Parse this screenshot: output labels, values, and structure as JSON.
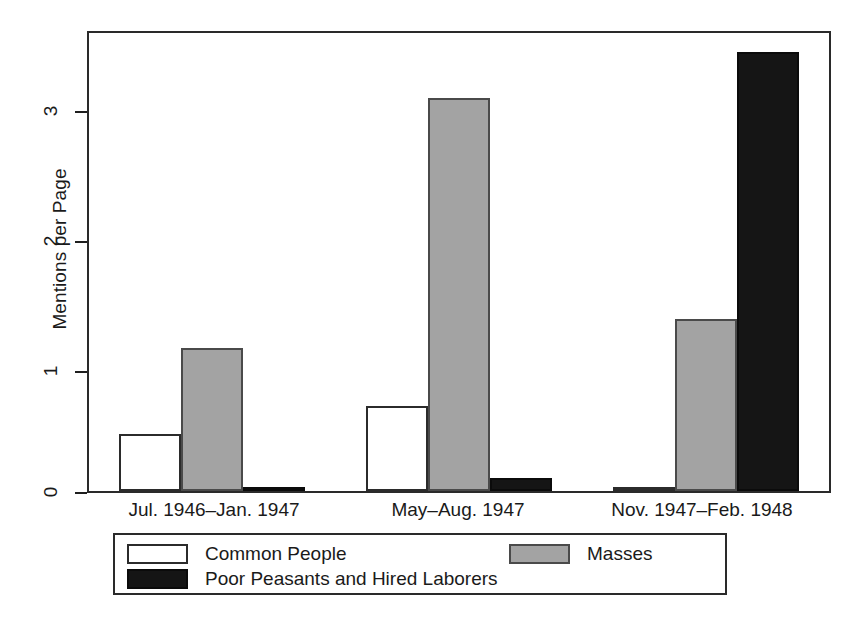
{
  "chart_data": {
    "type": "bar",
    "title": "",
    "xlabel": "",
    "ylabel": "Mentions per Page",
    "ylim": [
      0,
      3.55
    ],
    "yticks": [
      "0",
      "1",
      "2",
      "3"
    ],
    "grid": false,
    "legend_position": "bottom",
    "categories": [
      "Jul. 1946–Jan. 1947",
      "May–Aug. 1947",
      "Nov. 1947–Feb. 1948"
    ],
    "series": [
      {
        "name": "Common People",
        "color": "#ffffff",
        "edge_color": "#2b2b2b",
        "values": [
          0.44,
          0.66,
          0.01
        ]
      },
      {
        "name": "Masses",
        "color": "#a3a3a3",
        "edge_color": "#4a4a4a",
        "values": [
          1.11,
          3.05,
          1.33
        ]
      },
      {
        "name": "Poor Peasants and Hired Laborers",
        "color": "#151515",
        "edge_color": "#0b0b0b",
        "values": [
          0.03,
          0.1,
          3.4
        ]
      }
    ]
  },
  "axes": {
    "y_title": "Mentions per Page",
    "y_tick_labels": [
      "3",
      "2",
      "1",
      "0"
    ],
    "x_tick_labels": [
      "Jul. 1946–Jan. 1947",
      "May–Aug. 1947",
      "Nov. 1947–Feb. 1948"
    ]
  },
  "legend": {
    "entries": [
      {
        "label": "Common People",
        "swatch": "white-swatch"
      },
      {
        "label": "Masses",
        "swatch": "gray-swatch"
      },
      {
        "label": "Poor Peasants and Hired Laborers",
        "swatch": "black-swatch"
      }
    ]
  }
}
